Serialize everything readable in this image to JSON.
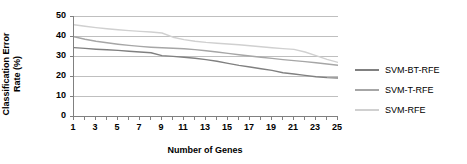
{
  "chart_data": {
    "type": "line",
    "title": "",
    "xlabel": "Number of Genes",
    "ylabel": "Classification Error Rate (%)",
    "ylabel_line1": "Classification Error",
    "ylabel_line2": "Rate (%)",
    "x": [
      1,
      2,
      3,
      4,
      5,
      6,
      7,
      8,
      9,
      10,
      11,
      12,
      13,
      14,
      15,
      16,
      17,
      18,
      19,
      20,
      21,
      22,
      23,
      24,
      25
    ],
    "xtick_labels": [
      "1",
      "3",
      "5",
      "7",
      "9",
      "11",
      "13",
      "15",
      "17",
      "19",
      "21",
      "23",
      "25"
    ],
    "xtick_values": [
      1,
      3,
      5,
      7,
      9,
      11,
      13,
      15,
      17,
      19,
      21,
      23,
      25
    ],
    "ytick_labels": [
      "0",
      "10",
      "20",
      "30",
      "40",
      "50"
    ],
    "ytick_values": [
      0,
      10,
      20,
      30,
      40,
      50
    ],
    "ylim": [
      0,
      50
    ],
    "xlim": [
      1,
      25
    ],
    "grid": true,
    "legend_position": "right",
    "series": [
      {
        "name": "SVM-BT-RFE",
        "color": "#808080",
        "values": [
          34.2,
          33.8,
          33.4,
          33.1,
          32.8,
          32.4,
          32.0,
          31.6,
          30.2,
          29.8,
          29.4,
          28.9,
          28.2,
          27.4,
          26.3,
          25.3,
          24.5,
          23.6,
          22.8,
          21.6,
          21.0,
          20.3,
          19.6,
          19.2,
          19.0
        ]
      },
      {
        "name": "SVM-T-RFE",
        "color": "#a6a6a6",
        "values": [
          39.6,
          38.4,
          37.4,
          36.6,
          35.9,
          35.3,
          34.8,
          34.4,
          34.1,
          33.9,
          33.6,
          33.2,
          32.6,
          32.0,
          31.3,
          30.6,
          30.0,
          29.4,
          28.8,
          28.2,
          27.7,
          27.2,
          26.6,
          26.0,
          25.4
        ]
      },
      {
        "name": "SVM-RFE",
        "color": "#d0d0d0",
        "values": [
          45.6,
          44.9,
          44.2,
          43.6,
          43.1,
          42.7,
          42.3,
          42.0,
          41.5,
          39.4,
          38.2,
          37.4,
          36.8,
          36.4,
          36.0,
          35.6,
          35.1,
          34.6,
          34.1,
          33.7,
          33.3,
          32.0,
          30.2,
          28.3,
          26.8
        ]
      }
    ]
  },
  "legend": {
    "entries": [
      {
        "label": "SVM-BT-RFE",
        "color": "#808080"
      },
      {
        "label": "SVM-T-RFE",
        "color": "#a6a6a6"
      },
      {
        "label": "SVM-RFE",
        "color": "#d0d0d0"
      }
    ]
  }
}
